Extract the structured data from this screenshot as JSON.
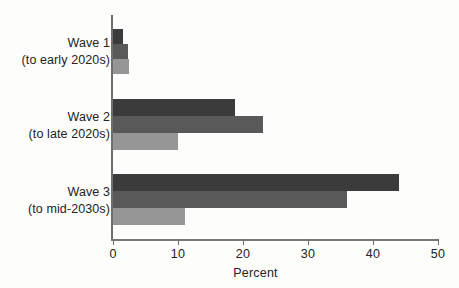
{
  "chart_data": {
    "type": "bar",
    "orientation": "horizontal",
    "title": "",
    "xlabel": "Percent",
    "ylabel": "",
    "xlim": [
      0,
      50
    ],
    "xticks": [
      0,
      10,
      20,
      30,
      40,
      50
    ],
    "xtick_labels": [
      "0",
      "10",
      "20",
      "30",
      "40",
      "50"
    ],
    "grid": false,
    "legend": "none",
    "categories": [
      "Wave 1",
      "Wave 2",
      "Wave 3"
    ],
    "category_sublabels": [
      "(to early 2020s)",
      "(to late 2020s)",
      "(to mid-2030s)"
    ],
    "series": [
      {
        "name": "series-1",
        "color": "#3b3b3b",
        "values": [
          1.5,
          18.8,
          44.0
        ]
      },
      {
        "name": "series-2",
        "color": "#595959",
        "values": [
          2.3,
          23.0,
          36.0
        ]
      },
      {
        "name": "series-3",
        "color": "#969696",
        "values": [
          2.5,
          10.0,
          11.0
        ]
      }
    ]
  },
  "axis": {
    "x_title": "Percent"
  },
  "groups": [
    {
      "label": "Wave 1",
      "sublabel": "(to early 2020s)",
      "top": 29,
      "bar_height": 15,
      "label_top": 35,
      "bars": [
        {
          "value": 1.5,
          "color": "#3b3b3b"
        },
        {
          "value": 2.3,
          "color": "#595959"
        },
        {
          "value": 2.5,
          "color": "#969696"
        }
      ]
    },
    {
      "label": "Wave 2",
      "sublabel": "(to late 2020s)",
      "top": 99,
      "bar_height": 17,
      "label_top": 109,
      "bars": [
        {
          "value": 18.8,
          "color": "#3b3b3b"
        },
        {
          "value": 23.0,
          "color": "#595959"
        },
        {
          "value": 10.0,
          "color": "#969696"
        }
      ]
    },
    {
      "label": "Wave 3",
      "sublabel": "(to mid-2030s)",
      "top": 174,
      "bar_height": 17,
      "label_top": 184,
      "bars": [
        {
          "value": 44.0,
          "color": "#3b3b3b"
        },
        {
          "value": 36.0,
          "color": "#595959"
        },
        {
          "value": 11.0,
          "color": "#969696"
        }
      ]
    }
  ],
  "ticks": [
    {
      "value": 0,
      "label": "0"
    },
    {
      "value": 10,
      "label": "10"
    },
    {
      "value": 20,
      "label": "20"
    },
    {
      "value": 30,
      "label": "30"
    },
    {
      "value": 40,
      "label": "40"
    },
    {
      "value": 50,
      "label": "50"
    }
  ]
}
